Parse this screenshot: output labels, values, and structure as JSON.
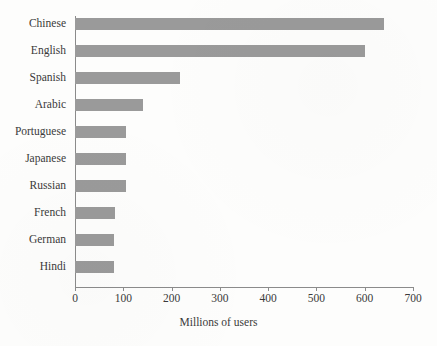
{
  "chart_data": {
    "type": "bar",
    "orientation": "horizontal",
    "title": "",
    "xlabel": "Millions of users",
    "ylabel": "",
    "xlim": [
      0,
      700
    ],
    "xticks": [
      0,
      100,
      200,
      300,
      400,
      500,
      600,
      700
    ],
    "xtick_labels": [
      "0",
      "100",
      "200",
      "300",
      "400",
      "500",
      "600",
      "700"
    ],
    "grid": false,
    "legend": null,
    "categories": [
      "Chinese",
      "English",
      "Spanish",
      "Arabic",
      "Portuguese",
      "Japanese",
      "Russian",
      "French",
      "German",
      "Hindi"
    ],
    "values": [
      640,
      600,
      217,
      140,
      105,
      105,
      105,
      82,
      80,
      80
    ],
    "series": [
      {
        "name": "Millions of users",
        "values": [
          640,
          600,
          217,
          140,
          105,
          105,
          105,
          82,
          80,
          80
        ]
      }
    ],
    "bar_color": "#9a9a9a",
    "axis_color": "#8b8b8b",
    "text_color": "#3a3a3a",
    "background_color": "#fdfdfc"
  }
}
